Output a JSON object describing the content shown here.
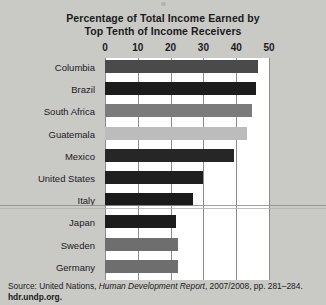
{
  "chart_data": {
    "type": "bar",
    "orientation": "horizontal",
    "title": "Percentage of Total Income Earned by Top Tenth of Income Receivers",
    "title_lines": [
      "Percentage of Total Income Earned by",
      "Top Tenth of Income Receivers"
    ],
    "xlabel": "",
    "ylabel": "",
    "xlim": [
      0,
      50
    ],
    "xticks": [
      0,
      10,
      20,
      30,
      40,
      50
    ],
    "grid": true,
    "legend": "none",
    "categories": [
      "Columbia",
      "Brazil",
      "South Africa",
      "Guatemala",
      "Mexico",
      "United States",
      "Italy",
      "Japan",
      "Sweden",
      "Germany"
    ],
    "values": [
      46.5,
      46.0,
      44.7,
      43.4,
      39.4,
      29.9,
      26.8,
      21.7,
      22.3,
      22.3
    ],
    "bar_colors": [
      "#4a4a4a",
      "#1c1c1c",
      "#7b7b7b",
      "#bcbcbc",
      "#262626",
      "#1f1f1f",
      "#1a1a1a",
      "#1c1c1c",
      "#6e6e6e",
      "#6e6e6e"
    ]
  },
  "source": {
    "prefix": "Source: United Nations,",
    "publication": "Human Development Report",
    "detail": ", 2007/2008, pp. 281–284.",
    "url": "hdr.undp.org."
  }
}
